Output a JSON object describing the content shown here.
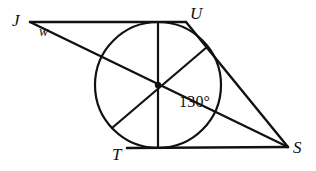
{
  "figure": {
    "kind": "geometry-diagram",
    "background_color": "#ffffff",
    "stroke_color": "#111111",
    "stroke_width": 2,
    "width": 316,
    "height": 171
  },
  "vertices": [
    {
      "id": "J",
      "label": "J",
      "x": 30,
      "y": 22
    },
    {
      "id": "U",
      "label": "U",
      "x": 186,
      "y": 22
    },
    {
      "id": "T",
      "label": "T",
      "x": 127,
      "y": 148
    },
    {
      "id": "S",
      "label": "S",
      "x": 288,
      "y": 147
    }
  ],
  "sides": [
    {
      "id": "JU",
      "from": "J",
      "to": "U",
      "x1": 30,
      "y1": 22,
      "x2": 186,
      "y2": 22
    },
    {
      "id": "JS",
      "from": "J",
      "to": "S",
      "x1": 30,
      "y1": 22,
      "x2": 288,
      "y2": 147
    },
    {
      "id": "US",
      "from": "U",
      "to": "S",
      "x1": 186,
      "y1": 22,
      "x2": 288,
      "y2": 147
    },
    {
      "id": "TS",
      "from": "T",
      "to": "S",
      "x1": 127,
      "y1": 148,
      "x2": 288,
      "y2": 147
    }
  ],
  "circle": {
    "id": "inscribed-circle",
    "cx": 158,
    "cy": 85,
    "r": 63,
    "fill": "none"
  },
  "center_point": {
    "id": "circle-center",
    "cx": 158,
    "cy": 85,
    "r": 3.2
  },
  "chords": [
    {
      "id": "vertical-diameter",
      "x1": 158,
      "y1": 22,
      "x2": 158,
      "y2": 148,
      "note": "vertical diameter from top tangent point to bottom tangent point"
    },
    {
      "id": "slanted-diameter",
      "x1": 112,
      "y1": 128,
      "x2": 207,
      "y2": 47,
      "note": "diameter through center toward tangent point on side US"
    }
  ],
  "labels": {
    "vertex_J": "J",
    "vertex_U": "U",
    "vertex_T": "T",
    "vertex_S": "S",
    "angle_w": "w",
    "angle_measure": "130°"
  }
}
